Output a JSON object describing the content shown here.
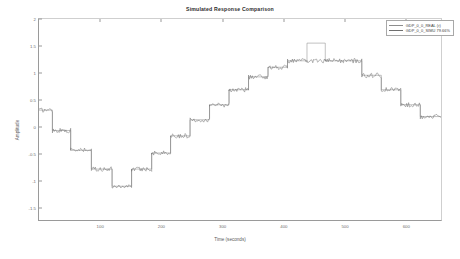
{
  "chart_data": {
    "type": "line",
    "title": "Simulated Response Comparison",
    "xlabel": "Time (seconds)",
    "ylabel": "Amplitude",
    "xlim": [
      0,
      660
    ],
    "ylim": [
      -1.75,
      2.0
    ],
    "grid": false,
    "legend_position": "top-right",
    "xticks": [
      100,
      200,
      300,
      400,
      500,
      600
    ],
    "xtick_labels": [
      "100",
      "200",
      "300",
      "400",
      "500",
      "600"
    ],
    "yticks": [
      2,
      1.5,
      1,
      0.5,
      0,
      -0.5,
      -1,
      -1.5
    ],
    "ytick_labels": [
      "2",
      "1.5",
      "1",
      "0.5",
      "0",
      "-0.5",
      "-1",
      "-1.5"
    ],
    "series": [
      {
        "name": "GDP_0_0_REAL (r)",
        "color": "#8d8d8d",
        "style": "smooth-staircase",
        "x": [
          0,
          22,
          22,
          52,
          52,
          86,
          86,
          120,
          120,
          152,
          152,
          185,
          185,
          216,
          216,
          248,
          248,
          280,
          280,
          312,
          312,
          344,
          344,
          376,
          376,
          408,
          408,
          440,
          440,
          470,
          470,
          500,
          500,
          530,
          530,
          562,
          562,
          594,
          594,
          626,
          626,
          660
        ],
        "y": [
          0.3,
          0.3,
          -0.08,
          -0.08,
          -0.45,
          -0.45,
          -0.8,
          -0.8,
          -1.12,
          -1.12,
          -0.8,
          -0.8,
          -0.5,
          -0.5,
          -0.18,
          -0.18,
          0.12,
          0.12,
          0.4,
          0.4,
          0.68,
          0.68,
          0.92,
          0.92,
          1.1,
          1.1,
          1.22,
          1.22,
          1.55,
          1.55,
          1.22,
          1.22,
          1.22,
          1.22,
          0.95,
          0.95,
          0.68,
          0.68,
          0.4,
          0.4,
          0.18,
          0.18
        ]
      },
      {
        "name": "GDP_0_0_SIMU 79.66%",
        "color": "#6f6f6f",
        "style": "noisy-staircase",
        "x": [
          0,
          22,
          22,
          52,
          52,
          86,
          86,
          120,
          120,
          152,
          152,
          185,
          185,
          216,
          216,
          248,
          248,
          280,
          280,
          312,
          312,
          344,
          344,
          376,
          376,
          408,
          408,
          440,
          440,
          470,
          470,
          500,
          500,
          530,
          530,
          562,
          562,
          594,
          594,
          626,
          626,
          660
        ],
        "y": [
          0.3,
          0.3,
          -0.08,
          -0.08,
          -0.45,
          -0.45,
          -0.8,
          -0.8,
          -1.12,
          -1.12,
          -0.8,
          -0.8,
          -0.5,
          -0.5,
          -0.18,
          -0.18,
          0.12,
          0.12,
          0.4,
          0.4,
          0.68,
          0.68,
          0.92,
          0.92,
          1.1,
          1.1,
          1.22,
          1.22,
          1.22,
          1.22,
          1.22,
          1.22,
          1.22,
          1.22,
          0.95,
          0.95,
          0.68,
          0.68,
          0.4,
          0.4,
          0.18,
          0.18
        ],
        "noise_amplitude": 0.045
      }
    ]
  },
  "legend": {
    "entries": [
      {
        "label": "GDP_0_0_REAL (r)",
        "color": "#8d8d8d"
      },
      {
        "label": "GDP_0_0_SIMU 79.66%",
        "color": "#6f6f6f"
      }
    ]
  }
}
